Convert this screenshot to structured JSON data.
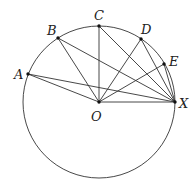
{
  "diagram": {
    "type": "circle-geometry",
    "circle": {
      "center": "O",
      "cx": 99,
      "cy": 102,
      "r": 76
    },
    "points": [
      {
        "id": "A",
        "label": "A",
        "x": 28,
        "y": 74,
        "lx": 14,
        "ly": 79
      },
      {
        "id": "B",
        "label": "B",
        "x": 58,
        "y": 38,
        "lx": 47,
        "ly": 35
      },
      {
        "id": "C",
        "label": "C",
        "x": 99,
        "y": 26,
        "lx": 94,
        "ly": 20
      },
      {
        "id": "D",
        "label": "D",
        "x": 141,
        "y": 39,
        "lx": 141,
        "ly": 34
      },
      {
        "id": "E",
        "label": "E",
        "x": 164,
        "y": 64,
        "lx": 169,
        "ly": 66
      },
      {
        "id": "X",
        "label": "X",
        "x": 175,
        "y": 102,
        "lx": 179,
        "ly": 108
      },
      {
        "id": "O",
        "label": "O",
        "x": 99,
        "y": 102,
        "lx": 91,
        "ly": 121
      }
    ],
    "segments": [
      [
        "O",
        "A"
      ],
      [
        "O",
        "B"
      ],
      [
        "O",
        "C"
      ],
      [
        "O",
        "D"
      ],
      [
        "O",
        "E"
      ],
      [
        "O",
        "X"
      ],
      [
        "X",
        "A"
      ],
      [
        "X",
        "B"
      ],
      [
        "X",
        "C"
      ],
      [
        "X",
        "D"
      ],
      [
        "X",
        "E"
      ]
    ],
    "colors": {
      "stroke": "#333333",
      "point": "#111111",
      "label": "#222222",
      "background": "#ffffff"
    }
  }
}
